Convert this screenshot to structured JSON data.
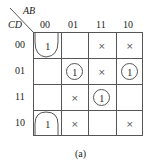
{
  "kmap": {
    "row_var": "CD",
    "col_var": "AB",
    "col_labels": [
      "00",
      "01",
      "11",
      "10"
    ],
    "row_labels": [
      "00",
      "01",
      "11",
      "10"
    ],
    "cells": [
      [
        "1",
        "",
        "×",
        "×"
      ],
      [
        "",
        "1",
        "×",
        "1"
      ],
      [
        "",
        "×",
        "1",
        ""
      ],
      [
        "1",
        "×",
        "",
        "×"
      ]
    ],
    "groups": [
      {
        "type": "wrap-top-bottom",
        "cells": [
          "m0",
          "m2"
        ]
      },
      {
        "type": "single",
        "cell": "m5"
      },
      {
        "type": "single",
        "cell": "m13"
      },
      {
        "type": "single",
        "cell": "m15"
      }
    ]
  },
  "caption": "(a)"
}
